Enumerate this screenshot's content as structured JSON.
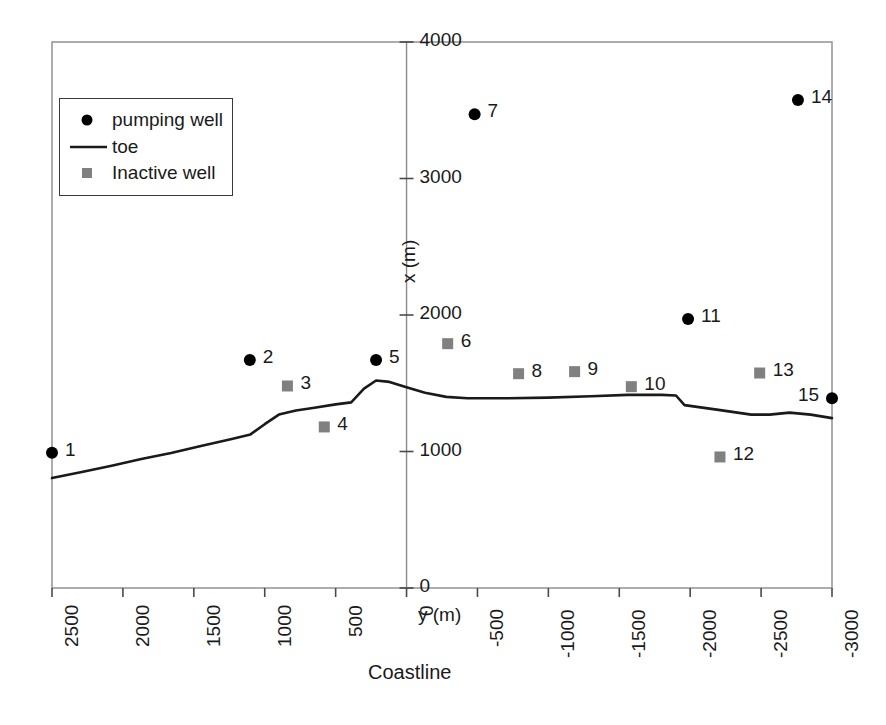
{
  "figure": {
    "caption": "Coastline",
    "xlabel": "y (m)",
    "ylabel": "x (m)"
  },
  "legend": {
    "items": [
      {
        "label": "pumping well",
        "marker": "circle",
        "color": "#000000"
      },
      {
        "label": "toe",
        "marker": "line",
        "color": "#1a1a1a"
      },
      {
        "label": "Inactive well",
        "marker": "square",
        "color": "#808080"
      }
    ]
  },
  "chart_data": {
    "type": "scatter",
    "title": "",
    "xlabel": "y (m)",
    "ylabel": "x (m)",
    "caption": "Coastline",
    "xlim": [
      2500,
      -3000
    ],
    "ylim": [
      0,
      4000
    ],
    "xticks": [
      2500,
      2000,
      1500,
      1000,
      500,
      0,
      -500,
      -1000,
      -1500,
      -2000,
      -2500,
      -3000
    ],
    "yticks": [
      0,
      1000,
      2000,
      3000,
      4000
    ],
    "xtick_labels": [
      "2500",
      "2000",
      "1500",
      "1000",
      "500",
      "0",
      "-500",
      "-1000",
      "-1500",
      "-2000",
      "-2500",
      "-3000"
    ],
    "ytick_labels": [
      "0",
      "1000",
      "2000",
      "3000",
      "4000"
    ],
    "grid": false,
    "legend_position": "upper-left",
    "series": [
      {
        "name": "pumping well",
        "type": "scatter",
        "marker": "circle",
        "color": "#000000",
        "points": [
          {
            "id": "1",
            "y": 2500,
            "x": 990,
            "label": "1",
            "label_side": "right"
          },
          {
            "id": "2",
            "y": 1105,
            "x": 1670,
            "label": "2",
            "label_side": "right"
          },
          {
            "id": "5",
            "y": 215,
            "x": 1670,
            "label": "5",
            "label_side": "right"
          },
          {
            "id": "7",
            "y": -480,
            "x": 3470,
            "label": "7",
            "label_side": "right"
          },
          {
            "id": "11",
            "y": -1985,
            "x": 1970,
            "label": "11",
            "label_side": "right"
          },
          {
            "id": "14",
            "y": -2760,
            "x": 3575,
            "label": "14",
            "label_side": "right"
          },
          {
            "id": "15",
            "y": -3000,
            "x": 1390,
            "label": "15",
            "label_side": "left"
          }
        ]
      },
      {
        "name": "Inactive well",
        "type": "scatter",
        "marker": "square",
        "color": "#808080",
        "points": [
          {
            "id": "3",
            "y": 840,
            "x": 1480,
            "label": "3",
            "label_side": "right"
          },
          {
            "id": "4",
            "y": 580,
            "x": 1180,
            "label": "4",
            "label_side": "right"
          },
          {
            "id": "6",
            "y": -290,
            "x": 1790,
            "label": "6",
            "label_side": "right"
          },
          {
            "id": "8",
            "y": -790,
            "x": 1570,
            "label": "8",
            "label_side": "right"
          },
          {
            "id": "9",
            "y": -1185,
            "x": 1585,
            "label": "9",
            "label_side": "right"
          },
          {
            "id": "10",
            "y": -1585,
            "x": 1475,
            "label": "10",
            "label_side": "right"
          },
          {
            "id": "12",
            "y": -2210,
            "x": 960,
            "label": "12",
            "label_side": "right"
          },
          {
            "id": "13",
            "y": -2490,
            "x": 1575,
            "label": "13",
            "label_side": "right"
          }
        ]
      },
      {
        "name": "toe",
        "type": "line",
        "color": "#1a1a1a",
        "points": [
          {
            "y": 2500,
            "x": 805
          },
          {
            "y": 2290,
            "x": 850
          },
          {
            "y": 2080,
            "x": 895
          },
          {
            "y": 1870,
            "x": 945
          },
          {
            "y": 1660,
            "x": 990
          },
          {
            "y": 1450,
            "x": 1040
          },
          {
            "y": 1240,
            "x": 1090
          },
          {
            "y": 1100,
            "x": 1125
          },
          {
            "y": 1000,
            "x": 1200
          },
          {
            "y": 900,
            "x": 1270
          },
          {
            "y": 780,
            "x": 1300
          },
          {
            "y": 650,
            "x": 1320
          },
          {
            "y": 500,
            "x": 1345
          },
          {
            "y": 390,
            "x": 1360
          },
          {
            "y": 300,
            "x": 1460
          },
          {
            "y": 215,
            "x": 1520
          },
          {
            "y": 120,
            "x": 1510
          },
          {
            "y": 0,
            "x": 1470
          },
          {
            "y": -130,
            "x": 1430
          },
          {
            "y": -280,
            "x": 1400
          },
          {
            "y": -430,
            "x": 1390
          },
          {
            "y": -700,
            "x": 1390
          },
          {
            "y": -1000,
            "x": 1395
          },
          {
            "y": -1300,
            "x": 1405
          },
          {
            "y": -1560,
            "x": 1415
          },
          {
            "y": -1800,
            "x": 1415
          },
          {
            "y": -1900,
            "x": 1410
          },
          {
            "y": -1960,
            "x": 1340
          },
          {
            "y": -2200,
            "x": 1305
          },
          {
            "y": -2430,
            "x": 1270
          },
          {
            "y": -2560,
            "x": 1270
          },
          {
            "y": -2700,
            "x": 1285
          },
          {
            "y": -2850,
            "x": 1270
          },
          {
            "y": -3000,
            "x": 1245
          }
        ]
      }
    ]
  }
}
